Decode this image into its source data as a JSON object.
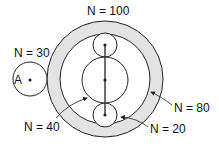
{
  "labels": {
    "ring_outer": "N = 100",
    "gear_a": "N = 30",
    "gear_a_name": "A",
    "ring_inner": "N = 80",
    "sun": "N = 40",
    "planet": "N = 20"
  },
  "colors": {
    "ring_fill": "#e3e3e3",
    "stroke": "#222222"
  }
}
